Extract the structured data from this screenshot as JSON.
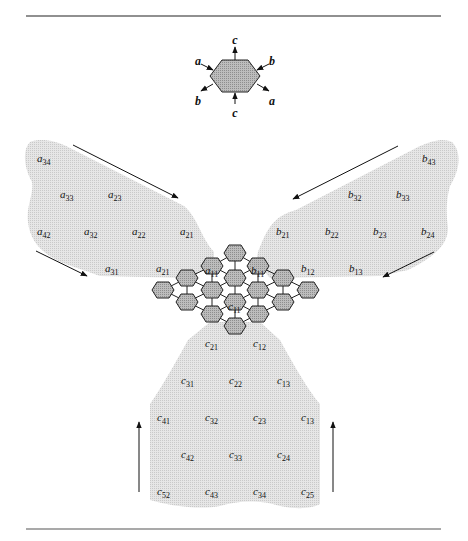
{
  "figure": {
    "legend_hex": {
      "center": [
        235,
        75
      ],
      "labels": [
        {
          "text": "c",
          "x": 235,
          "y": 40
        },
        {
          "text": "b",
          "x": 272,
          "y": 61
        },
        {
          "text": "a",
          "x": 272,
          "y": 101
        },
        {
          "text": "c",
          "x": 235,
          "y": 113
        },
        {
          "text": "b",
          "x": 198,
          "y": 101
        },
        {
          "text": "a",
          "x": 198,
          "y": 61
        }
      ]
    },
    "region_a": {
      "labels": [
        {
          "base": "a",
          "sub": "34",
          "x": 37,
          "y": 158
        },
        {
          "base": "a",
          "sub": "33",
          "x": 60,
          "y": 194
        },
        {
          "base": "a",
          "sub": "23",
          "x": 108,
          "y": 194
        },
        {
          "base": "a",
          "sub": "42",
          "x": 37,
          "y": 231
        },
        {
          "base": "a",
          "sub": "32",
          "x": 84,
          "y": 231
        },
        {
          "base": "a",
          "sub": "22",
          "x": 132,
          "y": 231
        },
        {
          "base": "a",
          "sub": "21",
          "x": 180,
          "y": 231
        },
        {
          "base": "a",
          "sub": "31",
          "x": 105,
          "y": 268
        },
        {
          "base": "a",
          "sub": "21",
          "x": 156,
          "y": 268
        }
      ]
    },
    "region_b": {
      "labels": [
        {
          "base": "b",
          "sub": "43",
          "x": 422,
          "y": 158
        },
        {
          "base": "b",
          "sub": "32",
          "x": 348,
          "y": 194
        },
        {
          "base": "b",
          "sub": "33",
          "x": 396,
          "y": 194
        },
        {
          "base": "b",
          "sub": "21",
          "x": 276,
          "y": 231
        },
        {
          "base": "b",
          "sub": "22",
          "x": 325,
          "y": 231
        },
        {
          "base": "b",
          "sub": "23",
          "x": 373,
          "y": 231
        },
        {
          "base": "b",
          "sub": "24",
          "x": 421,
          "y": 231
        },
        {
          "base": "b",
          "sub": "12",
          "x": 301,
          "y": 268
        },
        {
          "base": "b",
          "sub": "13",
          "x": 349,
          "y": 268
        }
      ]
    },
    "region_c": {
      "labels": [
        {
          "base": "c",
          "sub": "21",
          "x": 205,
          "y": 343
        },
        {
          "base": "c",
          "sub": "12",
          "x": 253,
          "y": 343
        },
        {
          "base": "c",
          "sub": "31",
          "x": 181,
          "y": 380
        },
        {
          "base": "c",
          "sub": "22",
          "x": 229,
          "y": 380
        },
        {
          "base": "c",
          "sub": "13",
          "x": 277,
          "y": 380
        },
        {
          "base": "c",
          "sub": "41",
          "x": 157,
          "y": 417
        },
        {
          "base": "c",
          "sub": "32",
          "x": 205,
          "y": 417
        },
        {
          "base": "c",
          "sub": "23",
          "x": 253,
          "y": 417
        },
        {
          "base": "c",
          "sub": "13",
          "x": 301,
          "y": 417
        },
        {
          "base": "c",
          "sub": "42",
          "x": 181,
          "y": 454
        },
        {
          "base": "c",
          "sub": "33",
          "x": 229,
          "y": 454
        },
        {
          "base": "c",
          "sub": "24",
          "x": 277,
          "y": 454
        },
        {
          "base": "c",
          "sub": "52",
          "x": 157,
          "y": 491
        },
        {
          "base": "c",
          "sub": "43",
          "x": 205,
          "y": 491
        },
        {
          "base": "c",
          "sub": "34",
          "x": 253,
          "y": 491
        },
        {
          "base": "c",
          "sub": "25",
          "x": 301,
          "y": 491
        }
      ]
    },
    "array_labels": [
      {
        "base": "a",
        "sub": "11",
        "x": 205,
        "y": 270
      },
      {
        "base": "b",
        "sub": "11",
        "x": 251,
        "y": 270
      },
      {
        "base": "c",
        "sub": "11",
        "x": 228,
        "y": 306
      }
    ],
    "hex_cells": [
      [
        235,
        253
      ],
      [
        212,
        266
      ],
      [
        258,
        266
      ],
      [
        187,
        278
      ],
      [
        235,
        278
      ],
      [
        283,
        278
      ],
      [
        163,
        290
      ],
      [
        212,
        290
      ],
      [
        258,
        290
      ],
      [
        308,
        290
      ],
      [
        187,
        302
      ],
      [
        235,
        302
      ],
      [
        283,
        302
      ],
      [
        212,
        314
      ],
      [
        258,
        314
      ],
      [
        235,
        326
      ]
    ],
    "colors": {
      "region_fill": "#e2e2e2",
      "hex_fill": "#b4b4b4",
      "hex_stroke": "#222222",
      "line": "#222222"
    }
  }
}
